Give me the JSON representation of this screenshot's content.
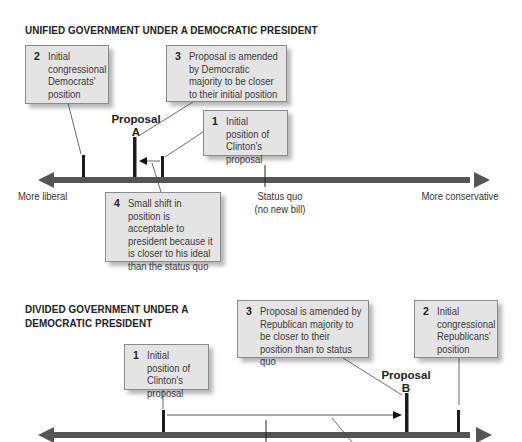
{
  "top_panel": {
    "title": "UNIFIED GOVERNMENT UNDER A DEMOCRATIC PRESIDENT",
    "boxes": [
      {
        "number": "2",
        "text": "Initial congressional Democrats' position"
      },
      {
        "number": "3",
        "text": "Proposal is amended by Democratic majority to be closer to their initial position"
      },
      {
        "number": "1",
        "text": "Initial position of Clinton's proposal"
      },
      {
        "number": "4",
        "text": "Small shift in position is acceptable to president because it is closer to his ideal than the status quo"
      }
    ],
    "proposal_label": "Proposal",
    "proposal_letter": "A",
    "axis_left": "More liberal",
    "axis_right": "More conservative",
    "status_quo": "Status quo",
    "status_quo_sub": "(no new bill)"
  },
  "bottom_panel": {
    "title_line1": "DIVIDED GOVERNMENT UNDER A",
    "title_line2": "DEMOCRATIC PRESIDENT",
    "boxes": [
      {
        "number": "1",
        "text": "Initial position of Clinton's proposal"
      },
      {
        "number": "3",
        "text": "Proposal is amended by Republican majority to be closer to their position than to status quo"
      },
      {
        "number": "2",
        "text": "Initial congressional Republicans' position"
      }
    ],
    "proposal_label": "Proposal",
    "proposal_letter": "B"
  },
  "colors": {
    "axis": "#555555",
    "box_fill": "#e4e4e4",
    "marker": "#1a1a1a"
  }
}
